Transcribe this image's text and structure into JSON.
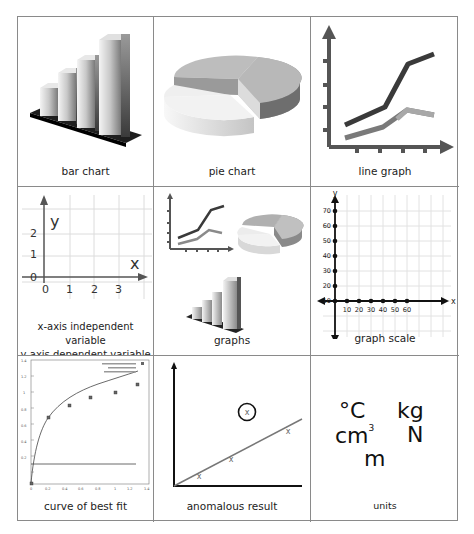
{
  "cells": [
    {
      "id": "bar-chart",
      "caption": "bar chart"
    },
    {
      "id": "pie-chart",
      "caption": "pie chart"
    },
    {
      "id": "line-graph",
      "caption": "line graph"
    },
    {
      "id": "axes",
      "caption_line1": "x-axis independent variable",
      "caption_line2": "y-axis dependent variable",
      "axis_labels": {
        "x": "x",
        "y": "y"
      },
      "x_ticks": [
        "0",
        "1",
        "2",
        "3"
      ],
      "y_ticks": [
        "0",
        "1",
        "2"
      ]
    },
    {
      "id": "graphs",
      "caption": "graphs"
    },
    {
      "id": "graph-scale",
      "caption": "graph scale",
      "axis_labels": {
        "x": "x",
        "y": "y"
      },
      "x_ticks": [
        "10",
        "20",
        "30",
        "40",
        "50",
        "60"
      ],
      "y_ticks": [
        "10",
        "20",
        "30",
        "40",
        "50",
        "60",
        "70"
      ]
    },
    {
      "id": "curve-best-fit",
      "caption": "curve of best fit",
      "x_ticks": [
        "0",
        "0.2",
        "0.4",
        "0.6",
        "0.8",
        "1",
        "1.2",
        "1.4"
      ],
      "y_ticks": [
        "0.2",
        "0.4",
        "0.6",
        "0.8",
        "1",
        "1.2",
        "1.4"
      ]
    },
    {
      "id": "anomalous-result",
      "caption": "anomalous result",
      "marker": "x"
    },
    {
      "id": "units",
      "caption": "units",
      "items": {
        "celsius": "°C",
        "kilogram": "kg",
        "cubic_cm": "cm",
        "cubic_exp": "3",
        "newton": "N",
        "metre": "m"
      }
    }
  ],
  "colors": {
    "border": "#8a8a8a",
    "line_dark": "#3a3a3a",
    "line_light": "#8c8c8c",
    "text": "#222222"
  }
}
